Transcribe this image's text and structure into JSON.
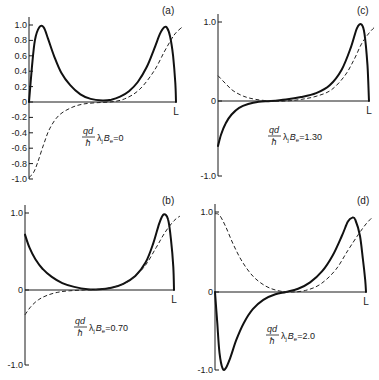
{
  "figure": {
    "x_end_label": "L",
    "formula_prefix": {
      "numerator": "qd",
      "denominator": "ħ",
      "lambda": "λ",
      "lambda_sub": "j",
      "B": "B",
      "B_sub": "e"
    }
  },
  "chart_data": [
    {
      "type": "line",
      "panel": "(a)",
      "parameter_value": "0",
      "formula": "qd/ħ λj Be=0",
      "xlabel": "",
      "ylabel": "",
      "x_tick_labels": [
        "L"
      ],
      "y_tick_labels": [
        "1.0",
        "0.8",
        "0.6",
        "0.4",
        "0.2",
        "0",
        "-0.2",
        "-0.4",
        "-0.6",
        "-0.8",
        "-1.0"
      ],
      "ylim": [
        -1.0,
        1.0
      ],
      "xlim": [
        0,
        1
      ],
      "grid": false,
      "series": [
        {
          "name": "solid",
          "style": "solid",
          "x": [
            0.0,
            0.02,
            0.04,
            0.07,
            0.1,
            0.13,
            0.17,
            0.22,
            0.28,
            0.35,
            0.42,
            0.5,
            0.56,
            0.62,
            0.68,
            0.74,
            0.8,
            0.85,
            0.89,
            0.92,
            0.94,
            0.96,
            0.98,
            0.995,
            1.0
          ],
          "y": [
            0.0,
            0.45,
            0.8,
            0.97,
            0.97,
            0.82,
            0.6,
            0.38,
            0.22,
            0.1,
            0.04,
            0.02,
            0.03,
            0.07,
            0.14,
            0.26,
            0.45,
            0.68,
            0.88,
            0.97,
            0.96,
            0.85,
            0.6,
            0.25,
            0.0
          ]
        },
        {
          "name": "dashed",
          "style": "dashed",
          "x": [
            0.0,
            0.03,
            0.06,
            0.1,
            0.14,
            0.2,
            0.28,
            0.36,
            0.45,
            0.55,
            0.65,
            0.75,
            0.85,
            0.92,
            0.97,
            1.0,
            1.04
          ],
          "y": [
            -0.98,
            -0.92,
            -0.78,
            -0.55,
            -0.35,
            -0.18,
            -0.08,
            -0.03,
            -0.01,
            0.0,
            0.04,
            0.16,
            0.4,
            0.65,
            0.82,
            0.9,
            0.97
          ]
        }
      ]
    },
    {
      "type": "line",
      "panel": "(c)",
      "parameter_value": "1.30",
      "formula": "qd/ħ λj Be=1.30",
      "xlabel": "",
      "ylabel": "",
      "x_tick_labels": [
        "L"
      ],
      "y_tick_labels": [
        "1.0",
        "0",
        "-1.0"
      ],
      "ylim": [
        -1.0,
        1.0
      ],
      "xlim": [
        0,
        1
      ],
      "grid": false,
      "series": [
        {
          "name": "solid",
          "style": "solid",
          "x": [
            0.0,
            0.02,
            0.05,
            0.09,
            0.14,
            0.2,
            0.27,
            0.35,
            0.45,
            0.55,
            0.65,
            0.74,
            0.82,
            0.88,
            0.92,
            0.95,
            0.97,
            0.99,
            1.0
          ],
          "y": [
            -0.6,
            -0.45,
            -0.3,
            -0.18,
            -0.09,
            -0.04,
            -0.01,
            0.0,
            0.02,
            0.05,
            0.1,
            0.2,
            0.4,
            0.68,
            0.92,
            0.97,
            0.85,
            0.45,
            0.0
          ]
        },
        {
          "name": "dashed",
          "style": "dashed",
          "x": [
            0.0,
            0.05,
            0.1,
            0.17,
            0.25,
            0.35,
            0.45,
            0.55,
            0.65,
            0.75,
            0.84,
            0.9,
            0.95,
            1.0,
            1.04
          ],
          "y": [
            0.32,
            0.22,
            0.13,
            0.06,
            0.02,
            0.0,
            0.0,
            0.02,
            0.06,
            0.14,
            0.32,
            0.52,
            0.72,
            0.86,
            0.94
          ]
        }
      ]
    },
    {
      "type": "line",
      "panel": "(b)",
      "parameter_value": "0.70",
      "formula": "qd/ħ λj Be=0.70",
      "xlabel": "",
      "ylabel": "",
      "x_tick_labels": [
        "L"
      ],
      "y_tick_labels": [
        "1.0",
        "0",
        "-1.0"
      ],
      "ylim": [
        -1.0,
        1.0
      ],
      "xlim": [
        0,
        1
      ],
      "grid": false,
      "series": [
        {
          "name": "solid",
          "style": "solid",
          "x": [
            0.0,
            0.03,
            0.07,
            0.12,
            0.18,
            0.25,
            0.33,
            0.42,
            0.5,
            0.58,
            0.66,
            0.74,
            0.81,
            0.86,
            0.9,
            0.93,
            0.96,
            0.98,
            0.995,
            1.0
          ],
          "y": [
            0.72,
            0.55,
            0.4,
            0.27,
            0.17,
            0.09,
            0.04,
            0.01,
            0.01,
            0.03,
            0.08,
            0.18,
            0.36,
            0.6,
            0.86,
            0.98,
            0.92,
            0.65,
            0.3,
            0.0
          ]
        },
        {
          "name": "dashed",
          "style": "dashed",
          "x": [
            0.0,
            0.04,
            0.09,
            0.15,
            0.22,
            0.3,
            0.4,
            0.5,
            0.6,
            0.7,
            0.8,
            0.88,
            0.94,
            1.0,
            1.04
          ],
          "y": [
            -0.33,
            -0.22,
            -0.13,
            -0.07,
            -0.03,
            -0.01,
            0.0,
            0.01,
            0.04,
            0.12,
            0.3,
            0.55,
            0.75,
            0.9,
            0.96
          ]
        }
      ]
    },
    {
      "type": "line",
      "panel": "(d)",
      "parameter_value": "2.0",
      "formula": "qd/ħ λj Be=2.0",
      "xlabel": "",
      "ylabel": "",
      "x_tick_labels": [
        "L"
      ],
      "y_tick_labels": [
        "1.0",
        "0",
        "-1.0"
      ],
      "ylim": [
        -1.0,
        1.0
      ],
      "xlim": [
        0,
        1
      ],
      "grid": false,
      "series": [
        {
          "name": "solid",
          "style": "solid",
          "x": [
            0.0,
            0.015,
            0.03,
            0.05,
            0.07,
            0.1,
            0.14,
            0.19,
            0.25,
            0.32,
            0.4,
            0.47,
            0.55,
            0.63,
            0.71,
            0.78,
            0.84,
            0.88,
            0.91,
            0.93,
            0.96,
            0.98,
            0.995,
            1.0
          ],
          "y": [
            0.0,
            -0.4,
            -0.78,
            -0.98,
            -0.98,
            -0.85,
            -0.62,
            -0.4,
            -0.22,
            -0.1,
            -0.03,
            0.0,
            0.04,
            0.12,
            0.26,
            0.46,
            0.7,
            0.88,
            0.93,
            0.9,
            0.7,
            0.4,
            0.15,
            0.0
          ]
        },
        {
          "name": "dashed",
          "style": "dashed",
          "x": [
            0.0,
            0.03,
            0.07,
            0.12,
            0.18,
            0.25,
            0.33,
            0.41,
            0.5,
            0.6,
            0.7,
            0.8,
            0.88,
            0.95,
            1.0,
            1.04
          ],
          "y": [
            0.98,
            0.96,
            0.82,
            0.6,
            0.38,
            0.2,
            0.08,
            0.02,
            0.0,
            0.02,
            0.1,
            0.28,
            0.52,
            0.72,
            0.85,
            0.93
          ]
        }
      ]
    }
  ],
  "panels_layout": [
    {
      "key": "a",
      "x0": 29,
      "x1": 176,
      "y_top": 25,
      "y_zero": 102,
      "y_bot": 179,
      "label_x": 162,
      "label_y": 14,
      "formula_x": 82,
      "formula_y": 137,
      "ticks": [
        1.0,
        0.8,
        0.6,
        0.4,
        0.2,
        0,
        -0.2,
        -0.4,
        -0.6,
        -0.8,
        -1.0
      ]
    },
    {
      "key": "c",
      "x0": 218,
      "x1": 369,
      "y_top": 22,
      "y_zero": 101,
      "y_bot": 176,
      "label_x": 357,
      "label_y": 14,
      "formula_x": 268,
      "formula_y": 136,
      "ticks": [
        1.0,
        0,
        -1.0
      ]
    },
    {
      "key": "b",
      "x0": 25,
      "x1": 174,
      "y_top": 213,
      "y_zero": 290,
      "y_bot": 365,
      "label_x": 162,
      "label_y": 204,
      "formula_x": 74,
      "formula_y": 327,
      "ticks": [
        1.0,
        0,
        -1.0
      ]
    },
    {
      "key": "d",
      "x0": 215,
      "x1": 366,
      "y_top": 212,
      "y_zero": 292,
      "y_bot": 370,
      "label_x": 357,
      "label_y": 204,
      "formula_x": 266,
      "formula_y": 335,
      "ticks": [
        1.0,
        0,
        -1.0
      ]
    }
  ]
}
